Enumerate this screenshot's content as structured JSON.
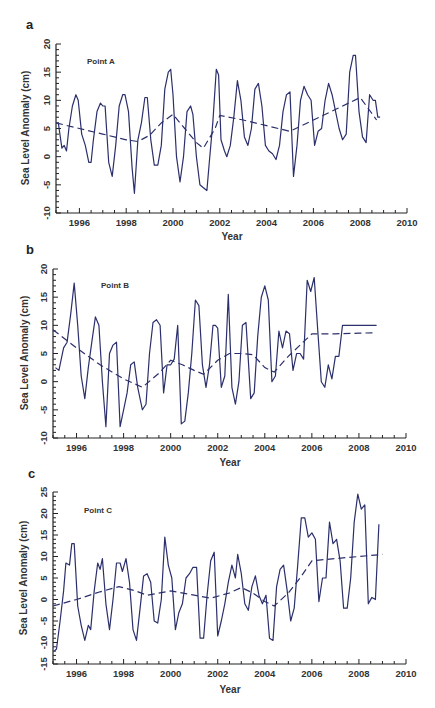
{
  "figure": {
    "panels": [
      {
        "letter": "a",
        "point_label": "Point A",
        "xlabel": "Year",
        "ylabel": "Sea Level Anomaly (cm)"
      },
      {
        "letter": "b",
        "point_label": "Point B",
        "xlabel": "Year",
        "ylabel": "Sea Level Anomaly (cm)"
      },
      {
        "letter": "c",
        "point_label": "Point C",
        "xlabel": "Year",
        "ylabel": "Sea Level Anomaly (cm)"
      }
    ]
  },
  "colors": {
    "series": "#2b2f6b",
    "axis": "#222222",
    "text": "#333333"
  },
  "chart_data": [
    {
      "type": "line",
      "title": "Point A",
      "panel": "a",
      "xlabel": "Year",
      "ylabel": "Sea Level Anomaly (cm)",
      "xlim": [
        1995,
        2010
      ],
      "ylim": [
        -10,
        20
      ],
      "xticks": [
        1996,
        1998,
        2000,
        2002,
        2004,
        2006,
        2008,
        2010
      ],
      "yticks": [
        -10,
        -5,
        0,
        5,
        10,
        15,
        20
      ],
      "grid": false,
      "legend": null,
      "series": [
        {
          "name": "Sea level anomaly",
          "style": "solid",
          "x": [
            1995.1,
            1995.25,
            1995.35,
            1995.45,
            1995.55,
            1995.7,
            1995.85,
            1995.95,
            1996.1,
            1996.25,
            1996.4,
            1996.5,
            1996.6,
            1996.75,
            1996.9,
            1997.0,
            1997.1,
            1997.25,
            1997.4,
            1997.55,
            1997.7,
            1997.85,
            1997.95,
            1998.1,
            1998.25,
            1998.35,
            1998.5,
            1998.65,
            1998.8,
            1998.9,
            1999.05,
            1999.2,
            1999.35,
            1999.5,
            1999.65,
            1999.8,
            1999.9,
            2000.0,
            2000.15,
            2000.3,
            2000.45,
            2000.6,
            2000.75,
            2000.85,
            2001.0,
            2001.15,
            2001.3,
            2001.45,
            2001.55,
            2001.7,
            2001.85,
            2001.95,
            2002.05,
            2002.2,
            2002.3,
            2002.45,
            2002.6,
            2002.75,
            2002.9,
            2003.05,
            2003.2,
            2003.35,
            2003.5,
            2003.65,
            2003.8,
            2003.95,
            2004.1,
            2004.25,
            2004.4,
            2004.55,
            2004.7,
            2004.85,
            2005.0,
            2005.15,
            2005.3,
            2005.45,
            2005.6,
            2005.75,
            2005.9,
            2006.05,
            2006.2,
            2006.35,
            2006.5,
            2006.65,
            2006.8,
            2006.95,
            2007.1,
            2007.25,
            2007.4,
            2007.55,
            2007.7,
            2007.8,
            2007.95,
            2008.1,
            2008.25,
            2008.4,
            2008.55,
            2008.65,
            2008.75,
            2008.85
          ],
          "y": [
            6,
            1.5,
            2,
            1,
            5,
            9,
            11,
            10,
            4,
            2,
            -1,
            -1,
            3,
            8,
            9.5,
            9,
            9,
            -1,
            -3.5,
            2,
            9,
            11,
            11,
            8,
            -2,
            -6.5,
            3,
            6,
            10.5,
            10.5,
            3,
            -1.5,
            -1.5,
            2,
            12,
            15,
            15.5,
            11,
            0,
            -4.5,
            0,
            8,
            9,
            7.5,
            0,
            -5,
            -5.5,
            -6,
            -1,
            6,
            15.5,
            14.5,
            3,
            1,
            0,
            2,
            7,
            13.5,
            10,
            3.5,
            2,
            5,
            12,
            13,
            9,
            2,
            1,
            0.5,
            -0.5,
            2,
            8,
            11,
            11.5,
            -3.5,
            2,
            10,
            12.5,
            11,
            10,
            2,
            4.5,
            5,
            10,
            13,
            11,
            8,
            5,
            3,
            4,
            15,
            18,
            18,
            8,
            3.5,
            2.5,
            11,
            10,
            10,
            7,
            7
          ]
        },
        {
          "name": "Trend (interannual)",
          "style": "dashed",
          "x": [
            1995.0,
            1996.0,
            1997.0,
            1998.0,
            1998.5,
            1999.0,
            1999.5,
            2000.0,
            2000.5,
            2001.0,
            2001.3,
            2001.8,
            2002.0,
            2003.0,
            2004.0,
            2005.0,
            2006.0,
            2007.0,
            2008.0,
            2008.7
          ],
          "y": [
            6,
            5,
            4,
            3,
            2.7,
            3.8,
            6,
            7.5,
            5,
            2.5,
            1.5,
            5,
            7.3,
            6.5,
            5.5,
            4.5,
            6.5,
            8.5,
            10.5,
            6.5
          ]
        }
      ]
    },
    {
      "type": "line",
      "title": "Point B",
      "panel": "b",
      "xlabel": "Year",
      "ylabel": "Sea Level Anomaly (cm)",
      "xlim": [
        1995,
        2010
      ],
      "ylim": [
        -10,
        20
      ],
      "xticks": [
        1996,
        1998,
        2000,
        2002,
        2004,
        2006,
        2008,
        2010
      ],
      "yticks": [
        -10,
        -5,
        0,
        5,
        10,
        15,
        20
      ],
      "grid": false,
      "legend": null,
      "series": [
        {
          "name": "Sea level anomaly",
          "style": "solid",
          "x": [
            1995.1,
            1995.25,
            1995.45,
            1995.6,
            1995.75,
            1995.9,
            1996.05,
            1996.2,
            1996.35,
            1996.5,
            1996.65,
            1996.8,
            1996.95,
            1997.1,
            1997.25,
            1997.4,
            1997.55,
            1997.7,
            1997.85,
            1998.0,
            1998.15,
            1998.3,
            1998.45,
            1998.6,
            1998.8,
            1998.95,
            1999.1,
            1999.25,
            1999.4,
            1999.55,
            1999.7,
            1999.85,
            2000.0,
            2000.15,
            2000.3,
            2000.45,
            2000.6,
            2000.75,
            2000.9,
            2001.05,
            2001.2,
            2001.35,
            2001.5,
            2001.65,
            2001.8,
            2001.9,
            2002.0,
            2002.15,
            2002.3,
            2002.45,
            2002.6,
            2002.75,
            2002.9,
            2003.05,
            2003.2,
            2003.4,
            2003.55,
            2003.7,
            2003.85,
            2004.0,
            2004.15,
            2004.3,
            2004.45,
            2004.6,
            2004.75,
            2004.9,
            2005.05,
            2005.2,
            2005.35,
            2005.5,
            2005.65,
            2005.8,
            2005.95,
            2006.1,
            2006.25,
            2006.4,
            2006.55,
            2006.7,
            2006.85,
            2007.0,
            2007.15,
            2007.3,
            2007.45,
            2007.6,
            2007.75,
            2007.85,
            2007.95,
            2008.1,
            2008.25,
            2008.4,
            2008.5,
            2008.6,
            2008.75
          ],
          "y": [
            2.5,
            2,
            6,
            7,
            12,
            17.5,
            10,
            1,
            -3,
            2.5,
            7,
            11.5,
            10,
            0,
            -8,
            5,
            6.5,
            7,
            -8,
            -5,
            -2,
            3,
            3.5,
            -1,
            -5,
            -4,
            5,
            10.5,
            11,
            10,
            -2,
            3,
            3,
            4,
            10,
            -7.5,
            -7,
            -2,
            5,
            14.5,
            13.5,
            3,
            -1,
            3,
            10,
            10,
            9.5,
            -1,
            1,
            15.5,
            -1,
            -4,
            0,
            10,
            10.5,
            -3,
            -2,
            8,
            15,
            17,
            14.5,
            0,
            1,
            9,
            6,
            9,
            8.5,
            2,
            5,
            5,
            4,
            18,
            16,
            18.5,
            9,
            0,
            -1,
            3,
            0.5,
            4.5,
            4.5,
            10,
            10,
            10,
            10,
            10,
            10,
            10,
            10,
            10,
            10,
            10,
            10
          ]
        },
        {
          "name": "Trend (interannual)",
          "style": "dashed",
          "x": [
            1995.0,
            1996.0,
            1997.0,
            1998.0,
            1998.8,
            1999.5,
            2000.0,
            2000.5,
            2001.0,
            2001.4,
            2002.0,
            2002.5,
            2003.0,
            2003.5,
            2004.0,
            2004.4,
            2005.0,
            2005.5,
            2006.0,
            2007.0,
            2008.0,
            2008.7
          ],
          "y": [
            9.2,
            6,
            3,
            0.5,
            -1,
            1.5,
            3.8,
            3,
            2,
            1.3,
            3.8,
            5,
            5,
            4.8,
            2.5,
            1.7,
            4.5,
            6.5,
            8.5,
            8.5,
            8.6,
            8.7
          ]
        }
      ]
    },
    {
      "type": "line",
      "title": "Point C",
      "panel": "c",
      "xlabel": "Year",
      "ylabel": "Sea Level Anomaly (cm)",
      "xlim": [
        1995,
        2010
      ],
      "ylim": [
        -15,
        25
      ],
      "xticks": [
        1996,
        1998,
        2000,
        2002,
        2004,
        2006,
        2008,
        2010
      ],
      "yticks": [
        -15,
        -10,
        -5,
        0,
        5,
        10,
        15,
        20,
        25
      ],
      "grid": false,
      "legend": null,
      "series": [
        {
          "name": "Sea level anomaly",
          "style": "solid",
          "x": [
            1995.05,
            1995.15,
            1995.3,
            1995.45,
            1995.55,
            1995.7,
            1995.8,
            1995.9,
            1996.05,
            1996.2,
            1996.35,
            1996.5,
            1996.6,
            1996.75,
            1996.9,
            1997.0,
            1997.1,
            1997.25,
            1997.4,
            1997.55,
            1997.7,
            1997.85,
            1997.95,
            1998.1,
            1998.25,
            1998.4,
            1998.55,
            1998.7,
            1998.85,
            1999.0,
            1999.15,
            1999.3,
            1999.45,
            1999.6,
            1999.75,
            1999.9,
            2000.05,
            2000.2,
            2000.35,
            2000.5,
            2000.65,
            2000.8,
            2000.95,
            2001.1,
            2001.25,
            2001.4,
            2001.55,
            2001.7,
            2001.85,
            2002.0,
            2002.15,
            2002.3,
            2002.45,
            2002.6,
            2002.75,
            2002.85,
            2003.0,
            2003.15,
            2003.3,
            2003.45,
            2003.6,
            2003.75,
            2003.9,
            2004.05,
            2004.2,
            2004.35,
            2004.5,
            2004.65,
            2004.8,
            2004.95,
            2005.1,
            2005.25,
            2005.4,
            2005.55,
            2005.7,
            2005.85,
            2006.0,
            2006.15,
            2006.3,
            2006.45,
            2006.6,
            2006.75,
            2006.9,
            2007.05,
            2007.2,
            2007.35,
            2007.5,
            2007.65,
            2007.8,
            2007.95,
            2008.1,
            2008.25,
            2008.4,
            2008.55,
            2008.7,
            2008.85
          ],
          "y": [
            -12,
            -11.5,
            -5,
            2,
            8.5,
            8,
            13,
            13,
            -1.5,
            -6,
            -9.5,
            -6,
            -7,
            2,
            8.5,
            7,
            9.5,
            -1,
            -7,
            0,
            8.5,
            8.5,
            6.5,
            9.5,
            4,
            -7,
            -9.5,
            -2,
            5.5,
            6,
            4,
            -5,
            -5.5,
            0,
            14.5,
            8,
            5,
            -7,
            -3,
            -1,
            5,
            6,
            7.5,
            7.5,
            -9,
            -9,
            1,
            9,
            11,
            -8.5,
            -5,
            -1,
            4,
            8,
            5,
            10.5,
            6,
            -1,
            -2.5,
            3,
            5.5,
            1,
            -1,
            1,
            -9,
            -9.5,
            3,
            7,
            8,
            2,
            -5,
            -2,
            8,
            19,
            19,
            14.5,
            15.5,
            14,
            -0.5,
            5,
            5,
            18,
            13,
            14,
            9,
            -2,
            -2,
            5,
            18,
            24.5,
            21,
            22,
            -1,
            0.5,
            0,
            17.5
          ]
        },
        {
          "name": "Trend (interannual)",
          "style": "dashed",
          "x": [
            1995.0,
            1996.0,
            1997.0,
            1997.8,
            1998.5,
            1999.0,
            2000.0,
            2001.0,
            2001.7,
            2002.5,
            2003.0,
            2003.5,
            2004.0,
            2004.4,
            2005.0,
            2005.5,
            2006.0,
            2007.0,
            2008.0,
            2009.0
          ],
          "y": [
            -1.5,
            0,
            1.8,
            3,
            2,
            1,
            2,
            1,
            0.3,
            1.5,
            2.8,
            1.5,
            -0.5,
            -1.5,
            1.5,
            5,
            9,
            9.5,
            10,
            10.5
          ]
        }
      ]
    }
  ]
}
